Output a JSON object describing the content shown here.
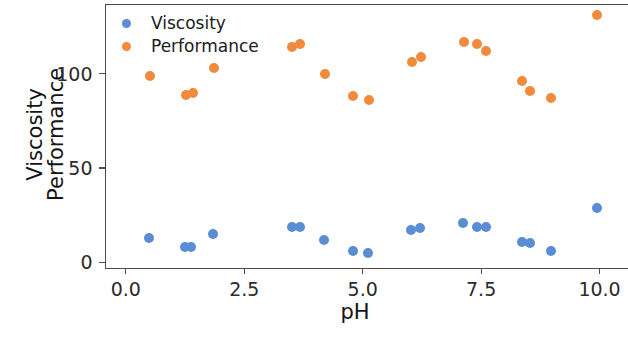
{
  "figure": {
    "background": "#ffffff",
    "width": 628,
    "height": 340
  },
  "axes": {
    "xlabel": "pH",
    "ylabel_line1": "Viscosity",
    "ylabel_line2": "Performance",
    "xticks": [
      "0.0",
      "2.5",
      "5.0",
      "7.5",
      "10.0"
    ],
    "yticks": [
      "0",
      "50",
      "100"
    ],
    "spine_color": "#4d4d4d"
  },
  "legend": {
    "entries": [
      {
        "label": "Viscosity",
        "color": "#5b8dd4"
      },
      {
        "label": "Performance",
        "color": "#f08b3c"
      }
    ]
  },
  "chart_data": {
    "type": "scatter",
    "title": "",
    "xlabel": "pH",
    "ylabel": "Viscosity\nPerformance",
    "xlim": [
      -0.45,
      10.6
    ],
    "ylim": [
      -3,
      137
    ],
    "xticks": [
      0.0,
      2.5,
      5.0,
      7.5,
      10.0
    ],
    "yticks": [
      0,
      50,
      100
    ],
    "grid": false,
    "legend_position": "upper left",
    "series": [
      {
        "name": "Viscosity",
        "color": "#5b8dd4",
        "points": [
          {
            "x": 0.5,
            "y": 13
          },
          {
            "x": 1.25,
            "y": 8
          },
          {
            "x": 1.38,
            "y": 8
          },
          {
            "x": 1.85,
            "y": 15
          },
          {
            "x": 3.52,
            "y": 19
          },
          {
            "x": 3.68,
            "y": 19
          },
          {
            "x": 4.2,
            "y": 12
          },
          {
            "x": 4.8,
            "y": 6
          },
          {
            "x": 5.12,
            "y": 5
          },
          {
            "x": 6.02,
            "y": 17
          },
          {
            "x": 6.22,
            "y": 18
          },
          {
            "x": 7.12,
            "y": 21
          },
          {
            "x": 7.42,
            "y": 19
          },
          {
            "x": 7.62,
            "y": 19
          },
          {
            "x": 8.38,
            "y": 11
          },
          {
            "x": 8.55,
            "y": 10
          },
          {
            "x": 8.98,
            "y": 6
          },
          {
            "x": 9.95,
            "y": 29
          }
        ]
      },
      {
        "name": "Performance",
        "color": "#f08b3c",
        "points": [
          {
            "x": 0.52,
            "y": 99
          },
          {
            "x": 1.28,
            "y": 89
          },
          {
            "x": 1.42,
            "y": 90
          },
          {
            "x": 1.88,
            "y": 103
          },
          {
            "x": 3.52,
            "y": 114
          },
          {
            "x": 3.68,
            "y": 116
          },
          {
            "x": 4.22,
            "y": 100
          },
          {
            "x": 4.8,
            "y": 88
          },
          {
            "x": 5.15,
            "y": 86
          },
          {
            "x": 6.05,
            "y": 106
          },
          {
            "x": 6.25,
            "y": 109
          },
          {
            "x": 7.15,
            "y": 117
          },
          {
            "x": 7.42,
            "y": 116
          },
          {
            "x": 7.62,
            "y": 112
          },
          {
            "x": 8.38,
            "y": 96
          },
          {
            "x": 8.55,
            "y": 91
          },
          {
            "x": 8.98,
            "y": 87
          },
          {
            "x": 9.95,
            "y": 131
          }
        ]
      }
    ]
  }
}
